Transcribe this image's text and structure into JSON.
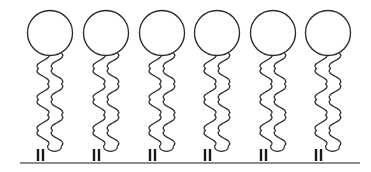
{
  "figure": {
    "kind": "scientific-schematic",
    "background_color": "#ffffff",
    "width": 371,
    "height": 172,
    "title": "",
    "caption": ""
  },
  "palette": {
    "outline": "#2b2b2b",
    "head_fill": "#ffffff",
    "anchor": "#1a1a1a",
    "substrate": "#8c8c8c",
    "background": "#ffffff"
  },
  "geometry": {
    "molecule_count": 6,
    "first_center_x": 50,
    "spacing_x": 55.6,
    "head": {
      "center_y": 33,
      "radius": 22.5,
      "stroke_width": 1.35
    },
    "tail": {
      "stroke_width": 1.25,
      "top_y": 53,
      "bottom_y": 146,
      "ribbon_half_width": 7,
      "wave_amplitude": 9,
      "wave_count": 3
    },
    "anchor": {
      "top_y": 149,
      "bottom_y": 161,
      "stroke_width": 2.4,
      "bar_offsets": [
        -4,
        1
      ],
      "bars_per_molecule": 2
    },
    "substrate": {
      "y": 163,
      "x_start": 20,
      "x_end": 360,
      "stroke_width": 2.0
    }
  },
  "molecules": [
    {
      "index": 1,
      "label": "molecule-1",
      "center_x": 50,
      "head_center_y": 33,
      "head_radius": 22.5,
      "anchor_x": 42
    },
    {
      "index": 2,
      "label": "molecule-2",
      "center_x": 106,
      "head_center_y": 33,
      "head_radius": 22.5,
      "anchor_x": 98
    },
    {
      "index": 3,
      "label": "molecule-3",
      "center_x": 162,
      "head_center_y": 33,
      "head_radius": 22.5,
      "anchor_x": 154
    },
    {
      "index": 4,
      "label": "molecule-4",
      "center_x": 217,
      "head_center_y": 33,
      "head_radius": 22.5,
      "anchor_x": 209
    },
    {
      "index": 5,
      "label": "molecule-5",
      "center_x": 273,
      "head_center_y": 33,
      "head_radius": 22.5,
      "anchor_x": 265
    },
    {
      "index": 6,
      "label": "molecule-6",
      "center_x": 328,
      "head_center_y": 33,
      "head_radius": 22.5,
      "anchor_x": 320
    }
  ],
  "labels": {
    "head_group": "head-group",
    "tail_chain": "hydrocarbon-tail",
    "anchor_group": "anchor-group",
    "substrate": "substrate-surface"
  }
}
